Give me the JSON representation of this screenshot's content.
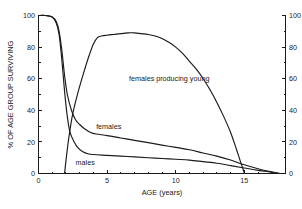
{
  "chart_data": {
    "type": "line",
    "title": "",
    "xlabel": "AGE (years)",
    "ylabel": "% OF AGE GROUP SURVIVING",
    "y2label": "",
    "xlim": [
      0,
      18
    ],
    "ylim": [
      0,
      100
    ],
    "y2lim": [
      0,
      100
    ],
    "grid": false,
    "legend": "inline-annotations",
    "xticks": [
      0,
      5,
      10,
      15
    ],
    "xticklabels": [
      "0",
      "5",
      "10",
      "15"
    ],
    "xminorticks": [
      1,
      2,
      3,
      4,
      6,
      7,
      8,
      9,
      11,
      12,
      13,
      14,
      16,
      17
    ],
    "yticks": [
      0,
      20,
      40,
      60,
      80,
      100
    ],
    "yticklabels": [
      "0",
      "20",
      "40",
      "60",
      "80",
      "100"
    ],
    "yminorticks": [
      10,
      30,
      50,
      70,
      90
    ],
    "y2ticks": [
      0,
      20,
      40,
      60,
      80,
      100
    ],
    "y2ticklabels": [
      "0",
      "20",
      "40",
      "60",
      "80",
      "100"
    ],
    "y2minorticks": [
      10,
      30,
      50,
      70,
      90
    ],
    "series": [
      {
        "name": "females",
        "label": "females",
        "axis": "left",
        "label_x": 4.2,
        "label_y": 30,
        "x": [
          0,
          0.5,
          1.0,
          1.3,
          1.5,
          1.7,
          1.9,
          2.1,
          2.4,
          2.7,
          3.0,
          3.4,
          3.8,
          4.2,
          5.0,
          6.0,
          7.0,
          8.0,
          9.0,
          10.0,
          11.0,
          12.0,
          13.0,
          14.0,
          15.0,
          16.0,
          17.0,
          17.6
        ],
        "values": [
          100,
          100,
          99,
          96,
          90,
          78,
          62,
          50,
          40,
          34,
          31,
          28,
          26,
          25,
          24,
          22.5,
          21,
          19.5,
          18,
          16.5,
          15,
          13,
          11,
          8.5,
          5.5,
          3,
          1,
          0
        ]
      },
      {
        "name": "males",
        "label": "males",
        "axis": "left",
        "label_x": 2.7,
        "label_y": 7,
        "x": [
          0,
          0.5,
          1.0,
          1.3,
          1.5,
          1.7,
          1.9,
          2.1,
          2.3,
          2.6,
          2.9,
          3.2,
          3.6,
          4.0,
          5.0,
          6.0,
          7.0,
          8.0,
          9.0,
          10.0,
          11.0,
          12.0,
          13.0,
          14.0,
          15.0,
          16.0,
          17.0,
          17.6
        ],
        "values": [
          100,
          100,
          99,
          95,
          88,
          72,
          52,
          36,
          26,
          20,
          16,
          14,
          12.5,
          12,
          11.5,
          11,
          10.5,
          10,
          9.5,
          9,
          8.5,
          7.5,
          6.5,
          5,
          3.5,
          2,
          0.8,
          0
        ]
      },
      {
        "name": "females producing young",
        "label": "females producing young",
        "axis": "right",
        "label_x": 6.6,
        "label_y": 60,
        "x": [
          1.9,
          2.0,
          2.2,
          2.5,
          2.9,
          3.3,
          3.7,
          4.0,
          4.3,
          4.6,
          5.0,
          5.5,
          6.0,
          6.5,
          7.0,
          7.5,
          8.0,
          8.5,
          9.0,
          9.5,
          10.0,
          10.5,
          11.0,
          11.5,
          12.0,
          12.5,
          13.0,
          13.5,
          14.0,
          14.4,
          14.7,
          14.9,
          15.0
        ],
        "values": [
          0,
          8,
          22,
          38,
          52,
          64,
          75,
          82,
          86,
          87,
          87.5,
          88,
          88.5,
          89,
          89,
          88.5,
          88,
          87,
          85.5,
          83,
          80,
          76,
          71,
          66,
          60,
          53,
          45,
          36,
          26,
          16,
          8,
          3,
          0
        ]
      }
    ]
  }
}
